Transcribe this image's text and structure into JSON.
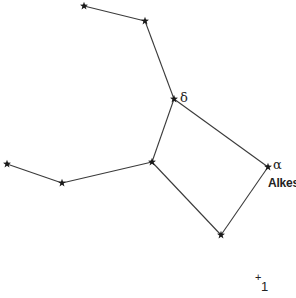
{
  "diagram": {
    "type": "constellation-chart",
    "stars": [
      {
        "id": "s1",
        "x": 84,
        "y": 6
      },
      {
        "id": "s2",
        "x": 145,
        "y": 21
      },
      {
        "id": "delta",
        "x": 174,
        "y": 99,
        "label": "δ"
      },
      {
        "id": "s4",
        "x": 152,
        "y": 162
      },
      {
        "id": "s5",
        "x": 62,
        "y": 183
      },
      {
        "id": "s6",
        "x": 7,
        "y": 164
      },
      {
        "id": "alpha",
        "x": 268,
        "y": 167,
        "label": "α",
        "name": "Alkes"
      },
      {
        "id": "s8",
        "x": 221,
        "y": 235
      }
    ],
    "edges": [
      [
        "s1",
        "s2"
      ],
      [
        "s2",
        "delta"
      ],
      [
        "delta",
        "s4"
      ],
      [
        "s4",
        "s5"
      ],
      [
        "s5",
        "s6"
      ],
      [
        "delta",
        "alpha"
      ],
      [
        "alpha",
        "s8"
      ],
      [
        "s8",
        "s4"
      ]
    ],
    "labels": {
      "delta": "δ",
      "alpha": "α",
      "alpha_name": "Alkes",
      "marker_plus": "+",
      "marker_number": "1"
    }
  }
}
